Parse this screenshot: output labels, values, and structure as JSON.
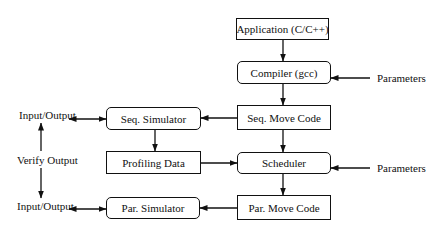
{
  "diagram": {
    "type": "flowchart",
    "nodes": {
      "application": "Application (C/C++)",
      "compiler": "Compiler (gcc)",
      "seq_move_code": "Seq. Move Code",
      "seq_simulator": "Seq. Simulator",
      "profiling_data": "Profiling Data",
      "scheduler": "Scheduler",
      "par_simulator": "Par. Simulator",
      "par_move_code": "Par. Move Code"
    },
    "labels": {
      "parameters_compiler": "Parameters",
      "parameters_scheduler": "Parameters",
      "io_top": "Input/Output",
      "verify_output": "Verify Output",
      "io_bottom": "Input/Output"
    },
    "edges": [
      {
        "from": "application",
        "to": "compiler"
      },
      {
        "from": "parameters_compiler",
        "to": "compiler"
      },
      {
        "from": "compiler",
        "to": "seq_move_code"
      },
      {
        "from": "seq_move_code",
        "to": "seq_simulator"
      },
      {
        "from": "seq_simulator",
        "to": "io_top",
        "bidirectional": true
      },
      {
        "from": "seq_simulator",
        "to": "profiling_data"
      },
      {
        "from": "seq_move_code",
        "to": "scheduler"
      },
      {
        "from": "profiling_data",
        "to": "scheduler"
      },
      {
        "from": "parameters_scheduler",
        "to": "scheduler"
      },
      {
        "from": "scheduler",
        "to": "par_move_code"
      },
      {
        "from": "par_move_code",
        "to": "par_simulator"
      },
      {
        "from": "par_simulator",
        "to": "io_bottom",
        "bidirectional": true
      },
      {
        "from": "verify_output",
        "to": "io_top"
      },
      {
        "from": "verify_output",
        "to": "io_bottom"
      }
    ]
  }
}
